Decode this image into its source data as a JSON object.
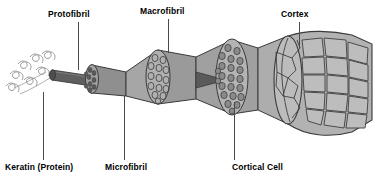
{
  "diagram": {
    "background_color": "#ffffff",
    "label_color": "#000000",
    "leader_color": "#4a4a4a",
    "palette": {
      "light_gray": "#c9c9c9",
      "mid_gray": "#a8a8a8",
      "dark_gray": "#6e6e6e",
      "darkest": "#4d4d4d",
      "outline": "#3a3a3a",
      "helix_stroke": "#9a9a9a"
    },
    "labels": [
      {
        "id": "protofibril",
        "text": "Protofibril",
        "x": 48,
        "y": 10,
        "leader_x": 78,
        "leader_y": 22,
        "leader_h": 48
      },
      {
        "id": "macrofibril",
        "text": "Macrofibril",
        "x": 140,
        "y": 7,
        "leader_x": 168,
        "leader_y": 19,
        "leader_h": 34
      },
      {
        "id": "cortex",
        "text": "Cortex",
        "x": 281,
        "y": 10,
        "leader_x": 299,
        "leader_y": 22,
        "leader_h": 26
      },
      {
        "id": "keratin",
        "text": "Keratin (Protein)",
        "x": 5,
        "y": 163,
        "leader_x": 43,
        "leader_y": 92,
        "leader_h": 68
      },
      {
        "id": "microfibril",
        "text": "Microfibril",
        "x": 105,
        "y": 163,
        "leader_x": 124,
        "leader_y": 96,
        "leader_h": 64
      },
      {
        "id": "cortical_cell",
        "text": "Cortical Cell",
        "x": 232,
        "y": 163,
        "leader_x": 234,
        "leader_y": 102,
        "leader_h": 58
      }
    ],
    "structures": [
      {
        "id": "keratin-helices",
        "name": "keratin alpha-helix coils",
        "count": 7
      },
      {
        "id": "protofibril-rod",
        "name": "protofibril rod"
      },
      {
        "id": "microfibril-tube",
        "name": "microfibril cylinder",
        "inner_circles": 9
      },
      {
        "id": "macrofibril-tube",
        "name": "macrofibril cylinder",
        "inner_circles": 14
      },
      {
        "id": "cortical-cell",
        "name": "cortical cell cylinder",
        "inner_circles": 22
      },
      {
        "id": "cortex-shaft",
        "name": "cortex hair shaft with cuticle scale cells"
      }
    ]
  }
}
